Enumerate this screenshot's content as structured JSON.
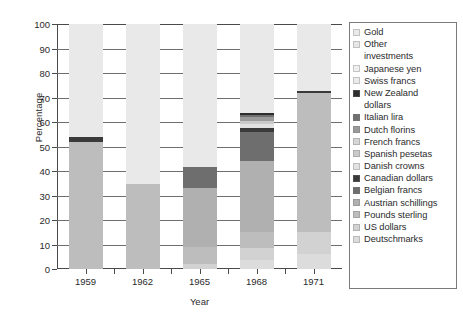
{
  "chart_data": {
    "type": "bar",
    "subtype": "stacked-bar",
    "title": "",
    "xlabel": "Year",
    "ylabel": "Percentage",
    "categories": [
      "1959",
      "1962",
      "1965",
      "1968",
      "1971"
    ],
    "ylim": [
      0,
      100
    ],
    "yticks": [
      0,
      10,
      20,
      30,
      40,
      50,
      60,
      70,
      80,
      90,
      100
    ],
    "grid": true,
    "grid_axis": "y",
    "legend_position": "right",
    "series": [
      {
        "name": "Deutschmarks",
        "color": "#dcdcdc",
        "values": [
          0.0,
          0.0,
          0.0,
          3.5,
          6.0
        ]
      },
      {
        "name": "US dollars",
        "color": "#d2d2d2",
        "values": [
          0.0,
          0.0,
          2.0,
          5.0,
          9.0
        ]
      },
      {
        "name": "Pounds sterling",
        "color": "#bdbdbd",
        "values": [
          52.0,
          34.5,
          7.0,
          6.5,
          57.0
        ]
      },
      {
        "name": "Austrian schillings",
        "color": "#b0b0b0",
        "values": [
          0.0,
          0.0,
          24.0,
          29.0,
          0.0
        ]
      },
      {
        "name": "Belgian francs",
        "color": "#6e6e6e",
        "values": [
          0.0,
          0.0,
          8.5,
          12.0,
          0.0
        ]
      },
      {
        "name": "Canadian dollars",
        "color": "#3a3a3a",
        "values": [
          2.0,
          0.0,
          0.0,
          1.5,
          0.8
        ]
      },
      {
        "name": "Danish crowns",
        "color": "#e2e2e2",
        "values": [
          0.0,
          0.0,
          0.0,
          1.5,
          0.0
        ]
      },
      {
        "name": "Spanish pesetas",
        "color": "#cacaca",
        "values": [
          0.0,
          0.0,
          0.0,
          1.5,
          0.0
        ]
      },
      {
        "name": "French francs",
        "color": "#d6d6d6",
        "values": [
          0.0,
          0.0,
          0.0,
          0.0,
          0.0
        ]
      },
      {
        "name": "Dutch florins",
        "color": "#9a9a9a",
        "values": [
          0.0,
          0.0,
          0.0,
          1.5,
          0.0
        ]
      },
      {
        "name": "Italian lira",
        "color": "#707070",
        "values": [
          0.0,
          0.0,
          0.0,
          1.0,
          0.0
        ]
      },
      {
        "name": "New Zealand dollars",
        "color": "#2e2e2e",
        "values": [
          0.0,
          0.0,
          0.0,
          0.5,
          0.0
        ]
      },
      {
        "name": "Swiss francs",
        "color": "#ebebeb",
        "values": [
          0.0,
          0.0,
          0.0,
          0.0,
          0.0
        ]
      },
      {
        "name": "Japanese yen",
        "color": "#efefef",
        "values": [
          0.0,
          0.0,
          0.0,
          0.0,
          0.0
        ]
      },
      {
        "name": "Other investments",
        "color": "#e6e6e6",
        "values": [
          0.0,
          0.0,
          0.0,
          0.0,
          0.0
        ]
      },
      {
        "name": "Gold",
        "color": "#e9e9e9",
        "values": [
          46.0,
          65.5,
          58.5,
          36.5,
          27.2
        ]
      }
    ],
    "bar_totals": [
      100,
      100,
      100,
      100,
      100
    ]
  },
  "axes": {
    "ylabel": "Percentage",
    "xlabel": "Year",
    "ytick_labels": [
      "100",
      "90",
      "80",
      "70",
      "60",
      "50",
      "40",
      "30",
      "20",
      "10",
      "0"
    ],
    "xtick_labels": [
      "1959",
      "1962",
      "1965",
      "1968",
      "1971"
    ]
  },
  "legend": {
    "items": [
      {
        "label": "Gold",
        "swatch": "#e9e9e9",
        "has_swatch": true
      },
      {
        "label": "Other",
        "swatch": "#e6e6e6",
        "has_swatch": true
      },
      {
        "label": "investments",
        "swatch": "",
        "has_swatch": false
      },
      {
        "label": "Japanese yen",
        "swatch": "#efefef",
        "has_swatch": true
      },
      {
        "label": "Swiss francs",
        "swatch": "#ebebeb",
        "has_swatch": true
      },
      {
        "label": "New Zealand",
        "swatch": "#2e2e2e",
        "has_swatch": true
      },
      {
        "label": "dollars",
        "swatch": "",
        "has_swatch": false
      },
      {
        "label": "Italian lira",
        "swatch": "#707070",
        "has_swatch": true
      },
      {
        "label": "Dutch florins",
        "swatch": "#9a9a9a",
        "has_swatch": true
      },
      {
        "label": "French francs",
        "swatch": "#d6d6d6",
        "has_swatch": true
      },
      {
        "label": "Spanish pesetas",
        "swatch": "#cacaca",
        "has_swatch": true
      },
      {
        "label": "Danish crowns",
        "swatch": "#e2e2e2",
        "has_swatch": true
      },
      {
        "label": "Canadian dollars",
        "swatch": "#3a3a3a",
        "has_swatch": true
      },
      {
        "label": "Belgian francs",
        "swatch": "#6e6e6e",
        "has_swatch": true
      },
      {
        "label": "Austrian schillings",
        "swatch": "#b0b0b0",
        "has_swatch": true
      },
      {
        "label": "Pounds sterling",
        "swatch": "#bdbdbd",
        "has_swatch": true
      },
      {
        "label": "US dollars",
        "swatch": "#d2d2d2",
        "has_swatch": true
      },
      {
        "label": "Deutschmarks",
        "swatch": "#dcdcdc",
        "has_swatch": true
      }
    ]
  }
}
